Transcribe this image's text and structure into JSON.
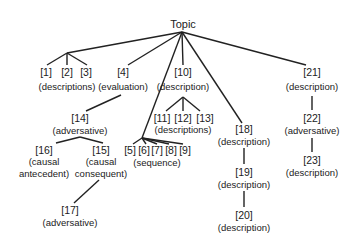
{
  "diagram": {
    "root": {
      "label": "Topic",
      "x": 183,
      "y": 19
    },
    "nodes": [
      {
        "id": "[1]",
        "x": 46,
        "y": 67
      },
      {
        "id": "[2]",
        "x": 67,
        "y": 67
      },
      {
        "id": "[3]",
        "x": 86,
        "y": 67
      },
      {
        "id": "[4]",
        "x": 123,
        "y": 67
      },
      {
        "id": "[10]",
        "x": 183,
        "y": 67
      },
      {
        "id": "[21]",
        "x": 312,
        "y": 67
      },
      {
        "id": "[11]",
        "x": 162,
        "y": 113
      },
      {
        "id": "[12]",
        "x": 183,
        "y": 113
      },
      {
        "id": "[13]",
        "x": 205,
        "y": 113
      },
      {
        "id": "[14]",
        "x": 80,
        "y": 113
      },
      {
        "id": "[22]",
        "x": 312,
        "y": 113
      },
      {
        "id": "[16]",
        "x": 44,
        "y": 145
      },
      {
        "id": "[15]",
        "x": 101,
        "y": 145
      },
      {
        "id": "[5]",
        "x": 130,
        "y": 145
      },
      {
        "id": "[6]",
        "x": 144,
        "y": 145
      },
      {
        "id": "[7]",
        "x": 157,
        "y": 145
      },
      {
        "id": "[8]",
        "x": 171,
        "y": 145
      },
      {
        "id": "[9]",
        "x": 185,
        "y": 145
      },
      {
        "id": "[18]",
        "x": 244,
        "y": 124
      },
      {
        "id": "[23]",
        "x": 312,
        "y": 155
      },
      {
        "id": "[19]",
        "x": 244,
        "y": 167
      },
      {
        "id": "[20]",
        "x": 244,
        "y": 210
      },
      {
        "id": "[17]",
        "x": 70,
        "y": 205
      }
    ],
    "descriptions": [
      {
        "text": "(descriptions)",
        "x": 67,
        "y": 82
      },
      {
        "text": "(evaluation)",
        "x": 123,
        "y": 82
      },
      {
        "text": "(description)",
        "x": 183,
        "y": 82
      },
      {
        "text": "(description)",
        "x": 312,
        "y": 82
      },
      {
        "text": "(descriptions)",
        "x": 183,
        "y": 125
      },
      {
        "text": "(adversative)",
        "x": 80,
        "y": 126
      },
      {
        "text": "(adversative)",
        "x": 312,
        "y": 126
      },
      {
        "text": "(causal",
        "x": 44,
        "y": 157
      },
      {
        "text": "antecedent)",
        "x": 44,
        "y": 169
      },
      {
        "text": "(causal",
        "x": 101,
        "y": 157
      },
      {
        "text": "consequent)",
        "x": 101,
        "y": 169
      },
      {
        "text": "(sequence)",
        "x": 157,
        "y": 158
      },
      {
        "text": "(description)",
        "x": 244,
        "y": 137
      },
      {
        "text": "(description)",
        "x": 312,
        "y": 168
      },
      {
        "text": "(description)",
        "x": 244,
        "y": 180
      },
      {
        "text": "(description)",
        "x": 244,
        "y": 223
      },
      {
        "text": "(adversative)",
        "x": 70,
        "y": 218
      }
    ],
    "edges": [
      {
        "from": "Topic",
        "to": "[1]-[3] group",
        "x1": 182,
        "y1": 32,
        "x2": 67,
        "y2": 53
      },
      {
        "from": "[1]-[3] group",
        "to": "[1]",
        "x1": 67,
        "y1": 53,
        "x2": 47,
        "y2": 65
      },
      {
        "from": "[1]-[3] group",
        "to": "[2]",
        "x1": 67,
        "y1": 53,
        "x2": 67,
        "y2": 65
      },
      {
        "from": "[1]-[3] group",
        "to": "[3]",
        "x1": 67,
        "y1": 53,
        "x2": 87,
        "y2": 65
      },
      {
        "from": "Topic",
        "to": "[4]",
        "x1": 182,
        "y1": 32,
        "x2": 128,
        "y2": 65
      },
      {
        "from": "Topic",
        "to": "[5]-[9] group",
        "x1": 182,
        "y1": 32,
        "x2": 142,
        "y2": 138
      },
      {
        "from": "Topic",
        "to": "[10]",
        "x1": 182,
        "y1": 32,
        "x2": 183,
        "y2": 65
      },
      {
        "from": "Topic",
        "to": "[18]",
        "x1": 182,
        "y1": 32,
        "x2": 242,
        "y2": 123
      },
      {
        "from": "Topic",
        "to": "[21]",
        "x1": 182,
        "y1": 32,
        "x2": 306,
        "y2": 65
      },
      {
        "from": "[10]",
        "to": "[11]",
        "x1": 183,
        "y1": 97,
        "x2": 166,
        "y2": 111
      },
      {
        "from": "[10]",
        "to": "[12]",
        "x1": 183,
        "y1": 97,
        "x2": 183,
        "y2": 111
      },
      {
        "from": "[10]",
        "to": "[13]",
        "x1": 183,
        "y1": 97,
        "x2": 200,
        "y2": 111
      },
      {
        "from": "[4]",
        "to": "[14]",
        "x1": 121,
        "y1": 95,
        "x2": 86,
        "y2": 111
      },
      {
        "from": "[14]",
        "to": "[16]",
        "x1": 80,
        "y1": 137,
        "x2": 56,
        "y2": 143
      },
      {
        "from": "[14]",
        "to": "[15]",
        "x1": 80,
        "y1": 137,
        "x2": 103,
        "y2": 143
      },
      {
        "from": "[15]",
        "to": "[17]",
        "x1": 99,
        "y1": 180,
        "x2": 74,
        "y2": 203
      },
      {
        "from": "[5]-[9] group",
        "to": "[5]",
        "x1": 142,
        "y1": 138,
        "x2": 133,
        "y2": 144
      },
      {
        "from": "[5]-[9] group",
        "to": "[6]",
        "x1": 142,
        "y1": 138,
        "x2": 146,
        "y2": 144
      },
      {
        "from": "[5]-[9] group",
        "to": "[7]",
        "x1": 142,
        "y1": 138,
        "x2": 157,
        "y2": 144
      },
      {
        "from": "[5]-[9] group",
        "to": "[8]",
        "x1": 142,
        "y1": 138,
        "x2": 169,
        "y2": 144
      },
      {
        "from": "[5]-[9] group",
        "to": "[9]",
        "x1": 142,
        "y1": 138,
        "x2": 183,
        "y2": 144
      },
      {
        "from": "[21]",
        "to": "[22]",
        "x1": 312,
        "y1": 96,
        "x2": 312,
        "y2": 110
      },
      {
        "from": "[22]",
        "to": "[23]",
        "x1": 312,
        "y1": 138,
        "x2": 312,
        "y2": 152
      },
      {
        "from": "[18]",
        "to": "[19]",
        "x1": 244,
        "y1": 148,
        "x2": 244,
        "y2": 164
      },
      {
        "from": "[19]",
        "to": "[20]",
        "x1": 244,
        "y1": 191,
        "x2": 244,
        "y2": 207
      }
    ]
  }
}
